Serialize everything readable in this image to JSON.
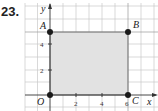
{
  "problem_number": "23.",
  "axes": {
    "x_label": "x",
    "y_label": "y"
  },
  "x_ticks": [
    "2",
    "4",
    "6"
  ],
  "y_ticks": [
    "2",
    "4"
  ],
  "points": [
    {
      "name": "O",
      "x": 0,
      "y": 0
    },
    {
      "name": "A",
      "x": 0,
      "y": 5
    },
    {
      "name": "B",
      "x": 6,
      "y": 5
    },
    {
      "name": "C",
      "x": 6,
      "y": 0
    }
  ],
  "colors": {
    "fill": "#e2e2e2",
    "grid": "#c8c8c8",
    "axis": "#333333",
    "point": "#1a1a1a"
  }
}
